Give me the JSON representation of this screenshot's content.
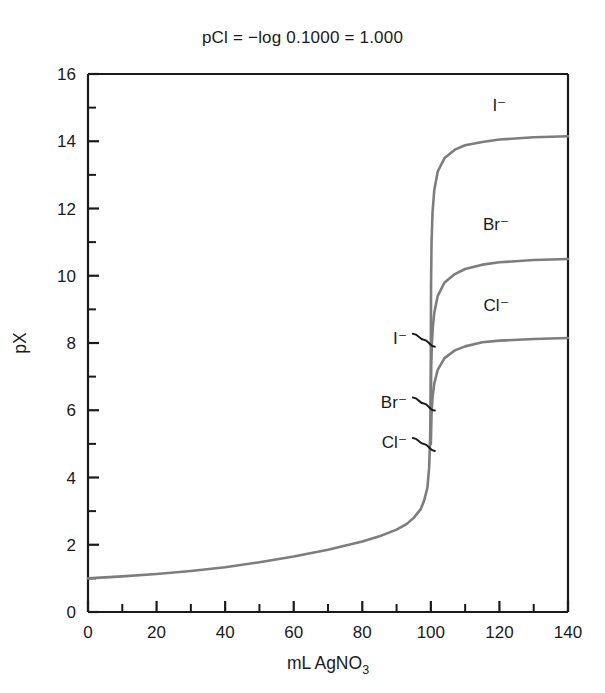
{
  "chart_data": {
    "type": "line",
    "title": "pCl = −log 0.1000 = 1.000",
    "xlabel": "mL AgNO3",
    "xlabel_main": "mL AgNO",
    "xlabel_sub": "3",
    "ylabel": "pX",
    "xlim": [
      0,
      140
    ],
    "ylim": [
      0,
      16
    ],
    "x_major_ticks": [
      0,
      20,
      40,
      60,
      80,
      100,
      120,
      140
    ],
    "x_major_tick_labels": [
      "0",
      "20",
      "40",
      "60",
      "80",
      "100",
      "120",
      "140"
    ],
    "x_minor_ticks": [
      10,
      30,
      50,
      70,
      90,
      110,
      130
    ],
    "y_major_ticks": [
      0,
      2,
      4,
      6,
      8,
      10,
      12,
      14,
      16
    ],
    "y_major_tick_labels": [
      "0",
      "2",
      "4",
      "6",
      "8",
      "10",
      "12",
      "14",
      "16"
    ],
    "y_minor_ticks": [
      1,
      3,
      5,
      7,
      9,
      11,
      13,
      15
    ],
    "grid": false,
    "legend": "inline-curve-labels",
    "curve_color": "#7d7d7d",
    "axis_color": "#1a1a1a",
    "equivalence_volume": 100,
    "series": [
      {
        "name": "I-",
        "label": "I⁻",
        "post_equivalence_plateau": 14.15,
        "equivalence_pX": 8.1,
        "points": [
          [
            0,
            1.0
          ],
          [
            5,
            1.03
          ],
          [
            10,
            1.06
          ],
          [
            20,
            1.13
          ],
          [
            30,
            1.22
          ],
          [
            40,
            1.33
          ],
          [
            50,
            1.48
          ],
          [
            60,
            1.65
          ],
          [
            70,
            1.85
          ],
          [
            80,
            2.1
          ],
          [
            85,
            2.25
          ],
          [
            90,
            2.45
          ],
          [
            93,
            2.62
          ],
          [
            95,
            2.8
          ],
          [
            97,
            3.05
          ],
          [
            98,
            3.3
          ],
          [
            99,
            3.7
          ],
          [
            99.5,
            4.3
          ],
          [
            99.8,
            5.2
          ],
          [
            99.95,
            6.5
          ],
          [
            100,
            8.1
          ],
          [
            100.05,
            9.7
          ],
          [
            100.2,
            11.0
          ],
          [
            100.5,
            11.9
          ],
          [
            101,
            12.55
          ],
          [
            102,
            13.1
          ],
          [
            104,
            13.5
          ],
          [
            107,
            13.75
          ],
          [
            110,
            13.88
          ],
          [
            115,
            13.98
          ],
          [
            120,
            14.05
          ],
          [
            130,
            14.12
          ],
          [
            140,
            14.15
          ]
        ]
      },
      {
        "name": "Br-",
        "label": "Br⁻",
        "post_equivalence_plateau": 10.5,
        "equivalence_pX": 6.2,
        "points": [
          [
            100,
            6.2
          ],
          [
            100.1,
            7.3
          ],
          [
            100.3,
            8.0
          ],
          [
            100.6,
            8.5
          ],
          [
            101,
            8.9
          ],
          [
            102,
            9.4
          ],
          [
            104,
            9.8
          ],
          [
            107,
            10.05
          ],
          [
            110,
            10.2
          ],
          [
            115,
            10.33
          ],
          [
            120,
            10.4
          ],
          [
            130,
            10.47
          ],
          [
            140,
            10.5
          ]
        ]
      },
      {
        "name": "Cl-",
        "label": "Cl⁻",
        "post_equivalence_plateau": 8.15,
        "equivalence_pX": 5.0,
        "points": [
          [
            100,
            5.0
          ],
          [
            100.2,
            5.9
          ],
          [
            100.5,
            6.4
          ],
          [
            101,
            6.8
          ],
          [
            102,
            7.2
          ],
          [
            104,
            7.55
          ],
          [
            107,
            7.78
          ],
          [
            110,
            7.9
          ],
          [
            115,
            8.02
          ],
          [
            120,
            8.07
          ],
          [
            130,
            8.12
          ],
          [
            140,
            8.15
          ]
        ]
      }
    ],
    "curve_labels_right": [
      {
        "text": "I⁻",
        "x": 120,
        "y": 14.9
      },
      {
        "text": "Br⁻",
        "x": 119,
        "y": 11.35
      },
      {
        "text": "Cl⁻",
        "x": 119,
        "y": 8.95
      }
    ],
    "break_markers": [
      {
        "text": "I⁻",
        "pX": 8.1
      },
      {
        "text": "Br⁻",
        "pX": 6.2
      },
      {
        "text": "Cl⁻",
        "pX": 5.0
      }
    ]
  }
}
